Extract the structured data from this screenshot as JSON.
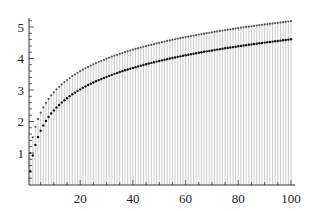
{
  "chart_data": {
    "type": "scatter",
    "title": "",
    "xlabel": "",
    "ylabel": "",
    "xlim": [
      0,
      100
    ],
    "ylim": [
      0,
      5.3
    ],
    "grid": false,
    "legend": null,
    "x_ticks": [
      20,
      40,
      60,
      80,
      100
    ],
    "y_ticks": [
      1,
      2,
      3,
      4,
      5
    ],
    "x": [
      1,
      2,
      3,
      4,
      5,
      6,
      7,
      8,
      9,
      10,
      11,
      12,
      13,
      14,
      15,
      16,
      17,
      18,
      19,
      20,
      21,
      22,
      23,
      24,
      25,
      26,
      27,
      28,
      29,
      30,
      31,
      32,
      33,
      34,
      35,
      36,
      37,
      38,
      39,
      40,
      41,
      42,
      43,
      44,
      45,
      46,
      47,
      48,
      49,
      50,
      51,
      52,
      53,
      54,
      55,
      56,
      57,
      58,
      59,
      60,
      61,
      62,
      63,
      64,
      65,
      66,
      67,
      68,
      69,
      70,
      71,
      72,
      73,
      74,
      75,
      76,
      77,
      78,
      79,
      80,
      81,
      82,
      83,
      84,
      85,
      86,
      87,
      88,
      89,
      90,
      91,
      92,
      93,
      94,
      95,
      96,
      97,
      98,
      99,
      100
    ],
    "series": [
      {
        "name": "upper",
        "color": "#555555",
        "values": [
          1.0,
          1.5,
          1.833,
          2.083,
          2.283,
          2.45,
          2.593,
          2.718,
          2.829,
          2.929,
          3.02,
          3.103,
          3.18,
          3.252,
          3.318,
          3.381,
          3.44,
          3.495,
          3.548,
          3.598,
          3.645,
          3.691,
          3.734,
          3.776,
          3.816,
          3.854,
          3.891,
          3.927,
          3.961,
          3.995,
          4.027,
          4.058,
          4.089,
          4.118,
          4.147,
          4.175,
          4.202,
          4.228,
          4.254,
          4.279,
          4.303,
          4.327,
          4.35,
          4.373,
          4.395,
          4.417,
          4.438,
          4.459,
          4.479,
          4.499,
          4.519,
          4.538,
          4.557,
          4.575,
          4.594,
          4.611,
          4.629,
          4.646,
          4.663,
          4.68,
          4.696,
          4.712,
          4.728,
          4.744,
          4.759,
          4.774,
          4.789,
          4.804,
          4.818,
          4.832,
          4.846,
          4.86,
          4.874,
          4.887,
          4.901,
          4.914,
          4.927,
          4.939,
          4.952,
          4.965,
          4.977,
          4.989,
          5.001,
          5.013,
          5.024,
          5.036,
          5.047,
          5.059,
          5.07,
          5.081,
          5.092,
          5.102,
          5.113,
          5.124,
          5.134,
          5.144,
          5.154,
          5.165,
          5.175,
          5.187
        ]
      },
      {
        "name": "lower",
        "color": "#111111",
        "values": [
          0.423,
          0.923,
          1.256,
          1.506,
          1.706,
          1.873,
          2.016,
          2.141,
          2.252,
          2.352,
          2.443,
          2.526,
          2.603,
          2.675,
          2.741,
          2.804,
          2.863,
          2.918,
          2.971,
          3.021,
          3.068,
          3.114,
          3.157,
          3.199,
          3.239,
          3.277,
          3.314,
          3.35,
          3.384,
          3.418,
          3.45,
          3.481,
          3.512,
          3.541,
          3.57,
          3.598,
          3.625,
          3.651,
          3.677,
          3.702,
          3.726,
          3.75,
          3.773,
          3.796,
          3.818,
          3.84,
          3.861,
          3.882,
          3.902,
          3.922,
          3.942,
          3.961,
          3.98,
          3.998,
          4.017,
          4.034,
          4.052,
          4.069,
          4.086,
          4.103,
          4.119,
          4.135,
          4.151,
          4.167,
          4.182,
          4.197,
          4.212,
          4.227,
          4.241,
          4.255,
          4.269,
          4.283,
          4.297,
          4.31,
          4.324,
          4.337,
          4.35,
          4.362,
          4.375,
          4.388,
          4.4,
          4.412,
          4.424,
          4.436,
          4.447,
          4.459,
          4.47,
          4.482,
          4.493,
          4.504,
          4.515,
          4.525,
          4.536,
          4.547,
          4.557,
          4.567,
          4.577,
          4.588,
          4.598,
          4.61
        ]
      }
    ],
    "stems": {
      "from": 0,
      "to": "upper",
      "color": "#bdbdbd"
    }
  }
}
